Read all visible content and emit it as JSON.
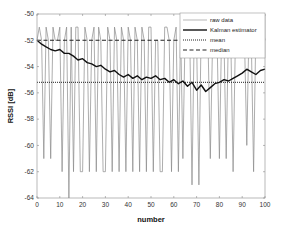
{
  "chart_data": {
    "type": "line",
    "title": "",
    "xlabel": "number",
    "ylabel": "RSSI [dB]",
    "xlim": [
      0,
      100
    ],
    "ylim": [
      -64,
      -50
    ],
    "xticks": [
      0,
      10,
      20,
      30,
      40,
      50,
      60,
      70,
      80,
      90,
      100
    ],
    "yticks": [
      -64,
      -62,
      -60,
      -58,
      -56,
      -54,
      -52,
      -50
    ],
    "grid": false,
    "legend_position": "upper right (inside)",
    "legend": [
      "raw data",
      "Kalman estimator",
      "mean",
      "median"
    ],
    "series": [
      {
        "name": "raw data",
        "style": "thin gray solid",
        "x": [
          0,
          1,
          2,
          3,
          4,
          5,
          6,
          7,
          8,
          9,
          10,
          11,
          12,
          13,
          14,
          15,
          16,
          17,
          18,
          19,
          20,
          21,
          22,
          23,
          24,
          25,
          26,
          27,
          28,
          29,
          30,
          31,
          32,
          33,
          34,
          35,
          36,
          37,
          38,
          39,
          40,
          41,
          42,
          43,
          44,
          45,
          46,
          47,
          48,
          49,
          50,
          51,
          52,
          53,
          54,
          55,
          56,
          57,
          58,
          59,
          60,
          61,
          62,
          63,
          64,
          65,
          66,
          67,
          68,
          69,
          70,
          71,
          72,
          73,
          74,
          75,
          76,
          77,
          78,
          79,
          80,
          81,
          82,
          83,
          84,
          85,
          86,
          87,
          88,
          89,
          90,
          91,
          92,
          93,
          94,
          95,
          96,
          97,
          98,
          99,
          100
        ],
        "values": [
          -52,
          -51,
          -52,
          -61,
          -51,
          -52,
          -61,
          -51,
          -52,
          -52,
          -51,
          -62,
          -52,
          -51,
          -64,
          -51,
          -62,
          -51,
          -51,
          -62,
          -62,
          -51,
          -52,
          -62,
          -52,
          -51,
          -62,
          -51,
          -52,
          -62,
          -62,
          -51,
          -52,
          -62,
          -51,
          -52,
          -62,
          -51,
          -52,
          -62,
          -51,
          -52,
          -62,
          -51,
          -52,
          -62,
          -51,
          -52,
          -62,
          -51,
          -51,
          -62,
          -52,
          -52,
          -62,
          -62,
          -51,
          -51,
          -52,
          -62,
          -52,
          -51,
          -62,
          -51,
          -61,
          -51,
          -52,
          -52,
          -63,
          -51,
          -52,
          -63,
          -51,
          -52,
          -52,
          -52,
          -61,
          -52,
          -51,
          -52,
          -61,
          -51,
          -52,
          -61,
          -51,
          -52,
          -62,
          -52,
          -51,
          -52,
          -51,
          -52,
          -60,
          -51,
          -52,
          -62,
          -51,
          -52,
          -52,
          -51,
          -52
        ]
      },
      {
        "name": "Kalman estimator",
        "style": "thick black solid",
        "x": [
          0,
          2,
          4,
          6,
          8,
          10,
          12,
          14,
          16,
          18,
          20,
          22,
          24,
          26,
          28,
          30,
          32,
          34,
          36,
          38,
          40,
          42,
          44,
          46,
          48,
          50,
          52,
          54,
          56,
          58,
          60,
          62,
          64,
          66,
          68,
          70,
          72,
          74,
          76,
          78,
          80,
          82,
          84,
          86,
          88,
          90,
          92,
          94,
          96,
          98,
          100
        ],
        "values": [
          -52.0,
          -52.3,
          -52.5,
          -52.7,
          -52.8,
          -52.7,
          -53.0,
          -53.0,
          -53.2,
          -53.5,
          -53.4,
          -53.7,
          -53.8,
          -54.0,
          -53.9,
          -54.2,
          -54.4,
          -54.3,
          -54.6,
          -54.8,
          -54.6,
          -54.9,
          -54.7,
          -55.0,
          -54.8,
          -54.9,
          -54.7,
          -55.0,
          -54.9,
          -55.2,
          -55.0,
          -55.3,
          -55.1,
          -55.5,
          -55.2,
          -55.8,
          -55.4,
          -55.9,
          -55.6,
          -55.3,
          -55.2,
          -55.0,
          -55.1,
          -54.9,
          -54.7,
          -54.5,
          -54.2,
          -54.4,
          -54.6,
          -54.3,
          -54.2
        ]
      },
      {
        "name": "mean",
        "style": "dotted black",
        "x": [
          0,
          100
        ],
        "values": [
          -55.2,
          -55.2
        ]
      },
      {
        "name": "median",
        "style": "dashed black",
        "x": [
          0,
          100
        ],
        "values": [
          -52.0,
          -52.0
        ]
      }
    ]
  },
  "ui": {
    "x_axis_label": "number",
    "y_axis_label": "RSSI [dB]",
    "legend_items": [
      "raw data",
      "Kalman estimator",
      "mean",
      "median"
    ],
    "colors": {
      "raw": "#8a8a8a",
      "kalman": "#111111",
      "mean": "#222222",
      "median": "#222222",
      "axis": "#777777"
    }
  }
}
